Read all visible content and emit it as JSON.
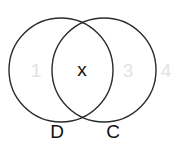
{
  "diagram": {
    "type": "venn",
    "sets": [
      {
        "name": "D",
        "label": "D",
        "cx": 61,
        "cy": 70,
        "r": 52
      },
      {
        "name": "C",
        "label": "C",
        "cx": 104,
        "cy": 70,
        "r": 52
      }
    ],
    "regions": [
      {
        "id": "only-d",
        "text": "1",
        "x": 36,
        "y": 77,
        "color": "#e2e2e2"
      },
      {
        "id": "intersection",
        "text": "x",
        "x": 82,
        "y": 76,
        "color": "#111111"
      },
      {
        "id": "only-c",
        "text": "3",
        "x": 128,
        "y": 77,
        "color": "#e2e2e2"
      },
      {
        "id": "outside",
        "text": "4",
        "x": 166,
        "y": 77,
        "color": "#e2e2e2"
      }
    ],
    "set_labels": [
      {
        "text": "D",
        "x": 57,
        "y": 138
      },
      {
        "text": "C",
        "x": 113,
        "y": 138
      }
    ],
    "stroke_color": "#2b2b2b",
    "label_color": "#111111"
  }
}
